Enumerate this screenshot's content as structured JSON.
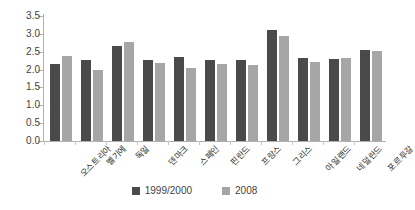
{
  "chart_data": {
    "type": "bar",
    "title": "",
    "subtitle": "",
    "xlabel": "",
    "ylabel": "",
    "ylim": [
      0.0,
      3.5
    ],
    "ytick_labels": [
      "3.5",
      "3.0",
      "2.5",
      "2.0",
      "1.5",
      "1.0",
      "0.5",
      "0.0"
    ],
    "ytick_values": [
      3.5,
      3.0,
      2.5,
      2.0,
      1.5,
      1.0,
      0.5,
      0.0
    ],
    "grid": false,
    "legend_position": "bottom",
    "categories": [
      "오스트리아",
      "벨기에",
      "독일",
      "덴마크",
      "스페인",
      "핀란드",
      "프랑스",
      "그리스",
      "아일랜드",
      "네덜란드",
      "포르투갈"
    ],
    "series": [
      {
        "name": "1999/2000",
        "color": "#4a4a4a",
        "values": [
          2.16,
          2.28,
          2.67,
          2.27,
          2.35,
          2.27,
          2.27,
          3.1,
          2.32,
          2.29,
          2.55
        ]
      },
      {
        "name": "2008",
        "color": "#a6a6a6",
        "values": [
          2.38,
          1.98,
          2.78,
          2.18,
          2.04,
          2.15,
          2.13,
          2.95,
          2.2,
          2.33,
          2.52
        ]
      }
    ]
  },
  "legend": {
    "items": [
      {
        "label": "1999/2000",
        "color": "#4a4a4a"
      },
      {
        "label": "2008",
        "color": "#a6a6a6"
      }
    ]
  }
}
